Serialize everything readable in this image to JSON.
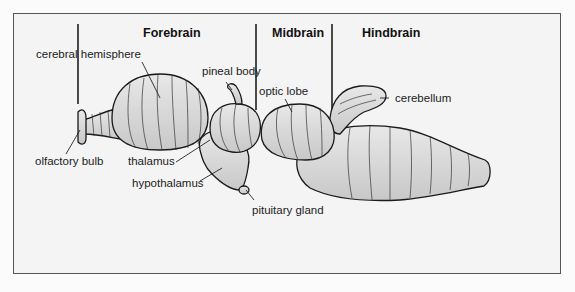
{
  "diagram": {
    "regions": [
      {
        "label": "Forebrain"
      },
      {
        "label": "Midbrain"
      },
      {
        "label": "Hindbrain"
      }
    ],
    "structures": [
      {
        "label": "cerebral hemisphere"
      },
      {
        "label": "pineal body"
      },
      {
        "label": "optic lobe"
      },
      {
        "label": "cerebellum"
      },
      {
        "label": "olfactory bulb"
      },
      {
        "label": "thalamus"
      },
      {
        "label": "hypothalamus"
      },
      {
        "label": "pituitary gland"
      }
    ],
    "colors": {
      "background": "#fbfbfb",
      "panel": "#f4f4f4",
      "outline": "#1a1a1a",
      "fill": "#d9d9d9"
    }
  }
}
